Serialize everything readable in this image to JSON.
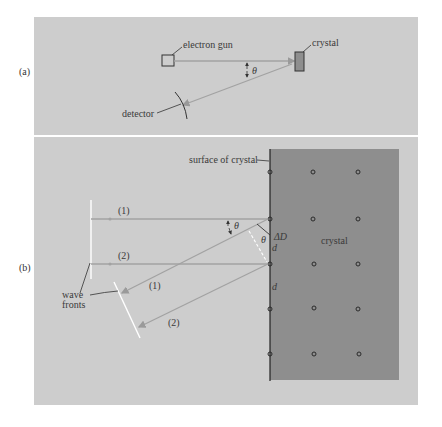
{
  "panel_a": {
    "part_label": "(a)",
    "labels": {
      "electron_gun": "electron gun",
      "crystal": "crystal",
      "detector": "detector",
      "angle": "θ"
    }
  },
  "panel_b": {
    "part_label": "(b)",
    "labels": {
      "surface": "surface of crystal",
      "crystal": "crystal",
      "ray1_in": "(1)",
      "ray2_in": "(2)",
      "ray1_out": "(1)",
      "ray2_out": "(2)",
      "angle1": "θ",
      "angle2": "θ",
      "delta_d": "ΔD",
      "d1": "d",
      "d2": "d",
      "wave_fronts_line1": "wave",
      "wave_fronts_line2": "fronts"
    },
    "lattice": {
      "columns_x": [
        270,
        313,
        358
      ],
      "rows_y": [
        172,
        219,
        264,
        309,
        354
      ]
    }
  },
  "colors": {
    "panel_bg": "#cdcdcd",
    "crystal_fill": "#8e8e8e",
    "ray": "#a2a2a2",
    "wavefront": "#ffffff",
    "ink": "#333333"
  }
}
